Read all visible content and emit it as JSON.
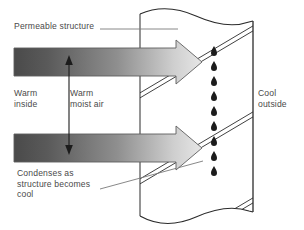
{
  "diagram": {
    "background_color": "#ffffff",
    "labels": {
      "permeable_structure": "Permeable structure",
      "warm_inside": "Warm\ninside",
      "warm_moist_air": "Warm\nmoist air",
      "condenses": "Condenses as\nstructure becomes\ncool",
      "cool_outside": "Cool\noutside"
    },
    "colors": {
      "text": "#4a4a4a",
      "line": "#2b2b2b",
      "leader_line": "#6f6f6f",
      "arrow_outline": "#585858",
      "arrow_gradient_start": "#4f4f4f",
      "arrow_gradient_end": "#e2e2e2",
      "droplet": "#1c1c1c",
      "wall_fill": "#ffffff"
    },
    "elements": {
      "wall": {
        "name": "permeable-wall",
        "left_edge_x": 140,
        "right_edge_x": 253,
        "top_y": 14,
        "bottom_y": 216,
        "edge_style": "torn-wavy"
      },
      "flow_arrows": [
        {
          "name": "warm-air-arrow-top",
          "y_center": 62,
          "x_start": 14,
          "x_tip": 202,
          "direction": "right"
        },
        {
          "name": "warm-air-arrow-bottom",
          "y_center": 148,
          "x_start": 14,
          "x_tip": 202,
          "direction": "right"
        }
      ],
      "thickness_arrow": {
        "name": "air-gap-double-arrow",
        "x": 69,
        "y_top": 57,
        "y_bottom": 152,
        "direction": "both"
      },
      "droplets": {
        "name": "condensation-droplets",
        "x": 214,
        "count": 9,
        "y_values": [
          49,
          64,
          79,
          94,
          109,
          124,
          139,
          154,
          169
        ]
      },
      "diagonal_layers": {
        "name": "structure-diagonal-lines",
        "count": 3,
        "style": "double-line",
        "slope": "up-right"
      },
      "leader_lines": [
        {
          "name": "leader-permeable-structure",
          "type": "horizontal",
          "x1": 100,
          "y1": 29,
          "x2": 178,
          "y2": 29
        },
        {
          "name": "leader-condenses",
          "type": "diagonal",
          "x1": 100,
          "y1": 188,
          "x2": 200,
          "y2": 162
        }
      ]
    }
  }
}
